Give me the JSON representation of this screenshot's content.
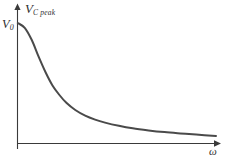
{
  "figure": {
    "background_color": "#ffffff",
    "axis_color": "#3a3a3a",
    "curve_color": "#4a4a4a"
  },
  "labels": {
    "y_axis_symbol": "V",
    "y_axis_subscript": "C peak",
    "y_value_symbol": "V",
    "y_value_subscript": "0",
    "x_axis_symbol": "ω"
  },
  "chart_data": {
    "type": "line",
    "title": "",
    "subtitle": "",
    "xlabel": "ω",
    "ylabel": "V C peak",
    "grid": false,
    "legend": null,
    "axis_arrows": true,
    "tick_labels_x": [],
    "tick_labels_y": [
      "V0"
    ],
    "xlim": [
      0,
      1
    ],
    "ylim": [
      0,
      1
    ],
    "annotations": [
      {
        "text": "V0",
        "x": 0,
        "y": 1.0,
        "position": "y-axis-intercept"
      },
      {
        "text": "ω",
        "x": 1.0,
        "y": 0,
        "position": "x-axis-end"
      },
      {
        "text": "V C peak",
        "x": 0.06,
        "y": 1.12,
        "position": "y-axis-top"
      }
    ],
    "series": [
      {
        "name": "V C peak",
        "x": [
          0.0,
          0.035,
          0.07,
          0.105,
          0.14,
          0.175,
          0.21,
          0.245,
          0.29,
          0.34,
          0.39,
          0.44,
          0.51,
          0.58,
          0.66,
          0.74,
          0.82,
          0.9,
          1.0
        ],
        "y": [
          1.0,
          0.96,
          0.86,
          0.72,
          0.59,
          0.48,
          0.4,
          0.335,
          0.275,
          0.228,
          0.195,
          0.17,
          0.143,
          0.122,
          0.105,
          0.091,
          0.08,
          0.07,
          0.058
        ]
      }
    ]
  }
}
